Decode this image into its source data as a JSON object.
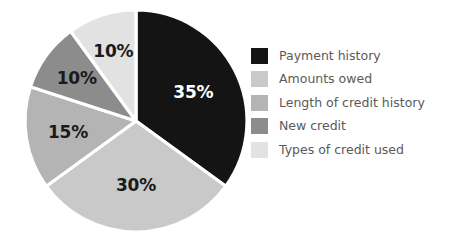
{
  "chart_data": {
    "type": "pie",
    "title": "",
    "subtitle": "",
    "xlabel": "",
    "ylabel": "",
    "grid": false,
    "legend_position": "right",
    "start_angle_deg": 0,
    "direction": "clockwise",
    "categories": [
      "Payment history",
      "Amounts owed",
      "Length of credit history",
      "New credit",
      "Types of credit used"
    ],
    "values": [
      35,
      30,
      15,
      10,
      10
    ],
    "data_labels": [
      "35%",
      "30%",
      "15%",
      "10%",
      "10%"
    ],
    "colors": [
      "#141414",
      "#c9c9c9",
      "#b4b4b4",
      "#8c8c8c",
      "#e2e2e2"
    ],
    "label_text_colors": [
      "#ffffff",
      "#1a1a1a",
      "#1a1a1a",
      "#1a1a1a",
      "#1a1a1a"
    ],
    "slice_separator_color": "#ffffff",
    "background_color": "#ffffff",
    "legend_text_color": "#5a5a5a",
    "slices": [
      {
        "label": "Payment history",
        "value": 35,
        "display": "35%",
        "color": "#141414",
        "label_color": "#ffffff"
      },
      {
        "label": "Amounts owed",
        "value": 30,
        "display": "30%",
        "color": "#c9c9c9",
        "label_color": "#1a1a1a"
      },
      {
        "label": "Length of credit history",
        "value": 15,
        "display": "15%",
        "color": "#b4b4b4",
        "label_color": "#1a1a1a"
      },
      {
        "label": "New credit",
        "value": 10,
        "display": "10%",
        "color": "#8c8c8c",
        "label_color": "#1a1a1a"
      },
      {
        "label": "Types of credit used",
        "value": 10,
        "display": "10%",
        "color": "#e2e2e2",
        "label_color": "#1a1a1a"
      }
    ]
  },
  "legend": {
    "items": [
      {
        "label": "Payment history",
        "color": "#141414"
      },
      {
        "label": "Amounts owed",
        "color": "#c9c9c9"
      },
      {
        "label": "Length of credit history",
        "color": "#b4b4b4"
      },
      {
        "label": "New credit",
        "color": "#8c8c8c"
      },
      {
        "label": "Types of credit used",
        "color": "#e2e2e2"
      }
    ]
  },
  "pie_geometry": {
    "center_x": 136,
    "center_y": 121,
    "radius": 111
  }
}
